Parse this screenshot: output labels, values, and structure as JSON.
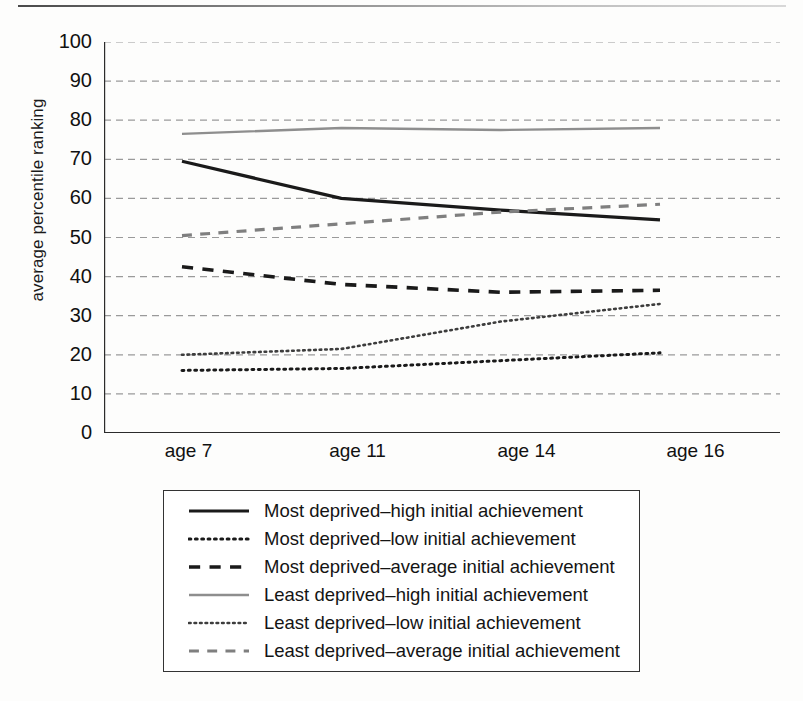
{
  "chart_data": {
    "type": "line",
    "title": "",
    "xlabel": "",
    "ylabel": "average percentile ranking",
    "x": [
      "age 7",
      "age 11",
      "age 14",
      "age 16"
    ],
    "categories": [
      "age 7",
      "age 11",
      "age 14",
      "age 16"
    ],
    "ylim": [
      0,
      100
    ],
    "ytick_values": [
      0,
      10,
      20,
      30,
      40,
      50,
      60,
      70,
      80,
      90,
      100
    ],
    "grid": true,
    "legend_position": "below-plot",
    "series": [
      {
        "name": "Most deprived–high initial achievement",
        "values": [
          69.5,
          60.0,
          57.0,
          54.5
        ],
        "style": "solid",
        "color": "#1a1a1a",
        "width": 3.2
      },
      {
        "name": "Most deprived–low initial achievement",
        "values": [
          16.0,
          16.5,
          18.5,
          20.5
        ],
        "style": "dotted",
        "color": "#1a1a1a",
        "width": 3.0
      },
      {
        "name": "Most deprived–average initial achievement",
        "values": [
          42.5,
          38.0,
          36.0,
          36.5
        ],
        "style": "dashed",
        "color": "#1a1a1a",
        "width": 3.6
      },
      {
        "name": "Least deprived–high initial achievement",
        "values": [
          76.5,
          78.0,
          77.5,
          78.0
        ],
        "style": "solid",
        "color": "#8e8e8e",
        "width": 2.4
      },
      {
        "name": "Least deprived–low initial achievement",
        "values": [
          20.0,
          21.5,
          28.5,
          33.0
        ],
        "style": "dotted",
        "color": "#3d3d3d",
        "width": 2.6
      },
      {
        "name": "Least deprived–average initial achievement",
        "values": [
          50.5,
          53.5,
          56.5,
          58.5
        ],
        "style": "dashed",
        "color": "#7f7f7f",
        "width": 3.2
      }
    ],
    "ytick_labels": [
      "100",
      "90",
      "80",
      "70",
      "60",
      "50",
      "40",
      "30",
      "20",
      "10",
      "0"
    ],
    "gridline_color": "#9a9a9a",
    "axis_color": "#2b2b2b"
  },
  "legend": {
    "items": [
      {
        "label": "Most deprived–high initial achievement"
      },
      {
        "label": "Most deprived–low initial achievement"
      },
      {
        "label": "Most deprived–average initial achievement"
      },
      {
        "label": "Least deprived–high initial achievement"
      },
      {
        "label": "Least deprived–low initial achievement"
      },
      {
        "label": "Least deprived–average initial achievement"
      }
    ]
  }
}
